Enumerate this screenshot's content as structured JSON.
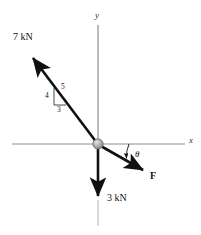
{
  "figure": {
    "axes": {
      "x_label": "x",
      "y_label": "y",
      "axis_color": "#8a8a8a"
    },
    "origin": {
      "label": "origin-pin",
      "color": "#9a9a9a"
    },
    "forces": [
      {
        "name": "upper-left-force",
        "label": "7 kN",
        "magnitude": 7,
        "unit": "kN",
        "direction": "up-left",
        "color": "#111111"
      },
      {
        "name": "downward-force",
        "label": "3 kN",
        "magnitude": 3,
        "unit": "kN",
        "direction": "down",
        "color": "#111111"
      },
      {
        "name": "unknown-force-F",
        "label": "F",
        "direction": "down-right",
        "color": "#111111"
      }
    ],
    "slope_triangle": {
      "name": "3-4-5-slope-triangle",
      "vertical": "4",
      "hypotenuse": "5",
      "horizontal": "3"
    },
    "angle": {
      "name": "angle-theta",
      "label": "θ",
      "between": "x-axis and F"
    }
  }
}
